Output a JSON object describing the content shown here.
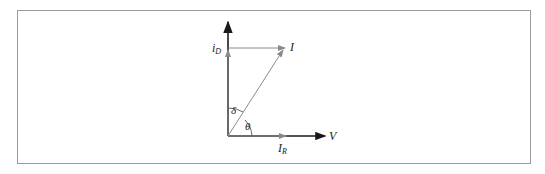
{
  "diagram": {
    "type": "phasor-diagram",
    "labels": {
      "i_d": "i",
      "i_d_sub": "D",
      "i": "I",
      "i_r": "I",
      "i_r_sub": "R",
      "v": "V",
      "delta": "δ",
      "theta": "θ"
    },
    "colors": {
      "axis": "#1a1a1a",
      "vector": "#8a8a8a",
      "frame": "#9a9a9a"
    }
  }
}
